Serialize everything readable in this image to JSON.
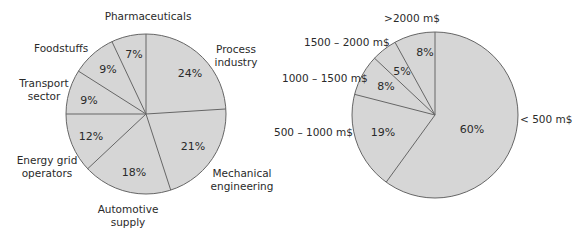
{
  "chart_data": [
    {
      "type": "pie",
      "title": "",
      "categories": [
        "Process industry",
        "Mechanical engineering",
        "Automotive supply",
        "Energy grid operators",
        "Transport sector",
        "Foodstuffs",
        "Pharmaceuticals"
      ],
      "values": [
        24,
        21,
        18,
        12,
        9,
        9,
        7
      ],
      "labels": [
        "24%",
        "21%",
        "18%",
        "12%",
        "9%",
        "9%",
        "7%"
      ],
      "fill_color": "#d6d6d6",
      "edge_color": "#666666"
    },
    {
      "type": "pie",
      "title": "",
      "categories": [
        "< 500 m$",
        "500 – 1000 m$",
        "1000 – 1500 m$",
        "1500 – 2000 m$",
        ">2000 m$"
      ],
      "values": [
        60,
        19,
        8,
        5,
        8
      ],
      "labels": [
        "60%",
        "19%",
        "8%",
        "5%",
        "8%"
      ],
      "fill_color": "#d6d6d6",
      "edge_color": "#666666"
    }
  ],
  "left": {
    "names": {
      "pharma": "Pharmaceuticals",
      "food": "Foodstuffs",
      "transport1": "Transport",
      "transport2": "sector",
      "energy1": "Energy grid",
      "energy2": "operators",
      "auto1": "Automotive",
      "auto2": "supply",
      "mech1": "Mechanical",
      "mech2": "engineering",
      "process1": "Process",
      "process2": "industry"
    },
    "pcts": {
      "process": "24%",
      "mech": "21%",
      "auto": "18%",
      "energy": "12%",
      "transport": "9%",
      "food": "9%",
      "pharma": "7%"
    }
  },
  "right": {
    "names": {
      "gt2000": ">2000 m$",
      "r1500": "1500 – 2000 m$",
      "r1000": "1000 – 1500 m$",
      "r500": "500 – 1000 m$",
      "lt500": "< 500 m$"
    },
    "pcts": {
      "gt2000": "8%",
      "r1500": "5%",
      "r1000": "8%",
      "r500": "19%",
      "lt500": "60%"
    }
  }
}
